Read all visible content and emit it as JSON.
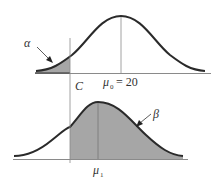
{
  "diagram": {
    "type": "hypothesis-test-error-regions",
    "colors": {
      "curve": "#2a2a2a",
      "shade": "#a6a6a6",
      "axis": "#8a8a8a",
      "text": "#333333"
    },
    "top_distribution": {
      "mean_label": "μ",
      "mean_subscript": "0",
      "mean_value_text": "= 20",
      "shaded_region_label": "α",
      "shaded_region_meaning": "left tail beyond C"
    },
    "bottom_distribution": {
      "mean_label": "μ",
      "mean_subscript": "1",
      "shaded_region_label": "β",
      "shaded_region_meaning": "area to the right of C"
    },
    "critical_value": {
      "label": "C"
    }
  }
}
